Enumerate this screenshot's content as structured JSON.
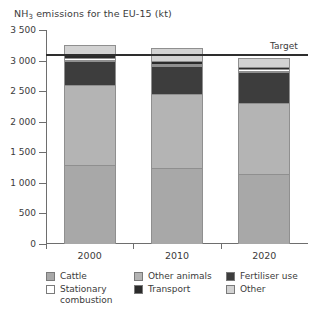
{
  "chart_data": {
    "type": "bar",
    "stacked": true,
    "title": "NH3 emissions for the EU-15 (kt)",
    "title_prefix": "NH",
    "title_subscript": "3",
    "title_suffix": " emissions for the EU-15 (kt)",
    "xlabel": "",
    "ylabel": "",
    "categories": [
      "2000",
      "2010",
      "2020"
    ],
    "ylim": [
      0,
      3500
    ],
    "yticks": [
      0,
      500,
      1000,
      1500,
      2000,
      2500,
      3000,
      3500
    ],
    "ytick_labels": [
      "0",
      "500",
      "1 000",
      "1 500",
      "2 000",
      "2 500",
      "3 000",
      "3 500"
    ],
    "grid": false,
    "legend_position": "bottom",
    "series": [
      {
        "name": "Cattle",
        "color": "#a8a8a8",
        "values": [
          1300,
          1250,
          1150
        ]
      },
      {
        "name": "Other animals",
        "color": "#b4b4b4",
        "values": [
          1300,
          1200,
          1150
        ]
      },
      {
        "name": "Fertiliser use",
        "color": "#3d3d3d",
        "values": [
          400,
          460,
          520
        ]
      },
      {
        "name": "Stationary combustion",
        "color": "#ffffff",
        "values": [
          40,
          40,
          40
        ]
      },
      {
        "name": "Transport",
        "color": "#2b2b2b",
        "values": [
          60,
          50,
          40
        ]
      },
      {
        "name": "Other",
        "color": "#d2d2d2",
        "values": [
          150,
          200,
          150
        ]
      }
    ],
    "totals": [
      3250,
      3200,
      3050
    ],
    "annotations": [
      {
        "name": "target",
        "label": "Target",
        "value": 3100,
        "type": "hline",
        "color": "#2e2e2e"
      }
    ]
  },
  "legend": {
    "items": [
      {
        "label": "Cattle",
        "color": "#a8a8a8"
      },
      {
        "label": "Other animals",
        "color": "#b4b4b4"
      },
      {
        "label": "Fertiliser use",
        "color": "#3d3d3d"
      },
      {
        "label": "Stationary combustion",
        "color": "#ffffff"
      },
      {
        "label": "Transport",
        "color": "#2b2b2b"
      },
      {
        "label": "Other",
        "color": "#d2d2d2"
      }
    ],
    "order": [
      0,
      1,
      2,
      3,
      4,
      5
    ]
  }
}
